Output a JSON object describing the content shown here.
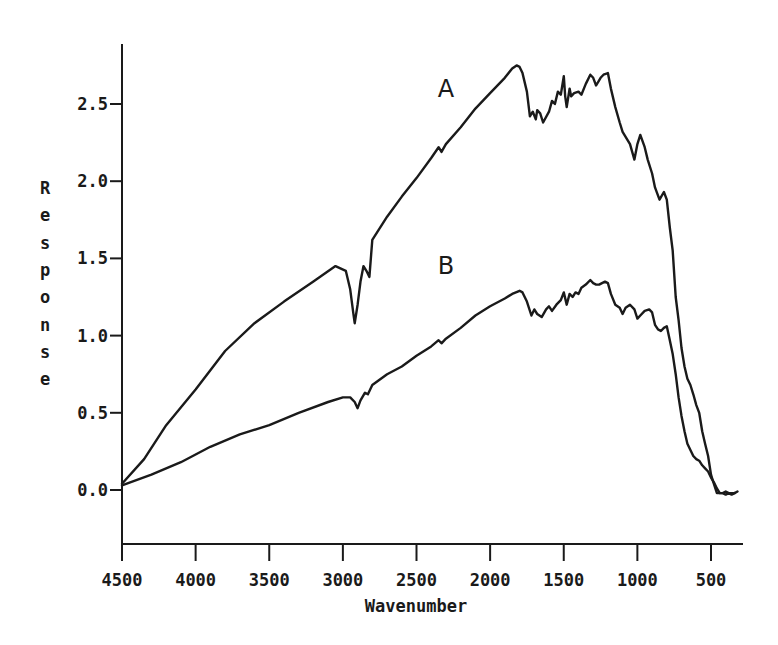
{
  "chart_data": {
    "type": "line",
    "title": "",
    "xlabel": "Wavenumber",
    "ylabel": "Response",
    "xlim": [
      4500,
      300
    ],
    "ylim": [
      -0.15,
      2.8
    ],
    "x_reversed": true,
    "grid": false,
    "legend": "inline labels",
    "x_ticks": [
      4500,
      4000,
      3500,
      3000,
      2500,
      2000,
      1500,
      1000,
      500
    ],
    "x_tick_labels": [
      "4500",
      "4000",
      "3500",
      "3000",
      "2500",
      "2000",
      "1500",
      "1000",
      "500"
    ],
    "y_ticks": [
      0.0,
      0.5,
      1.0,
      1.5,
      2.0,
      2.5
    ],
    "y_tick_labels": [
      "0.0",
      "0.5",
      "1.0",
      "1.5",
      "2.0",
      "2.5"
    ],
    "series": [
      {
        "name": "A",
        "label_position": [
          2300,
          2.6
        ],
        "x": [
          4500,
          4350,
          4200,
          4000,
          3800,
          3600,
          3400,
          3200,
          3050,
          2980,
          2950,
          2930,
          2920,
          2900,
          2880,
          2860,
          2840,
          2820,
          2800,
          2700,
          2600,
          2500,
          2400,
          2350,
          2330,
          2300,
          2200,
          2100,
          2000,
          1900,
          1850,
          1820,
          1800,
          1780,
          1750,
          1730,
          1710,
          1690,
          1680,
          1660,
          1640,
          1600,
          1580,
          1560,
          1540,
          1520,
          1500,
          1490,
          1480,
          1460,
          1450,
          1430,
          1400,
          1380,
          1350,
          1320,
          1300,
          1280,
          1250,
          1230,
          1200,
          1180,
          1150,
          1120,
          1100,
          1050,
          1020,
          1000,
          980,
          950,
          930,
          900,
          880,
          850,
          820,
          800,
          780,
          760,
          750,
          740,
          720,
          700,
          680,
          660,
          640,
          620,
          600,
          580,
          560,
          540,
          520,
          500,
          480,
          460,
          440,
          420,
          400,
          380,
          360,
          340,
          320
        ],
        "y": [
          0.04,
          0.2,
          0.42,
          0.65,
          0.9,
          1.08,
          1.22,
          1.35,
          1.45,
          1.42,
          1.3,
          1.15,
          1.08,
          1.2,
          1.35,
          1.45,
          1.42,
          1.38,
          1.62,
          1.77,
          1.9,
          2.02,
          2.15,
          2.22,
          2.19,
          2.24,
          2.35,
          2.47,
          2.57,
          2.67,
          2.73,
          2.75,
          2.74,
          2.7,
          2.58,
          2.42,
          2.45,
          2.4,
          2.46,
          2.44,
          2.38,
          2.45,
          2.52,
          2.5,
          2.58,
          2.56,
          2.68,
          2.55,
          2.48,
          2.6,
          2.55,
          2.57,
          2.58,
          2.56,
          2.63,
          2.69,
          2.67,
          2.62,
          2.67,
          2.69,
          2.7,
          2.6,
          2.48,
          2.38,
          2.32,
          2.24,
          2.14,
          2.24,
          2.3,
          2.22,
          2.14,
          2.05,
          1.96,
          1.88,
          1.93,
          1.88,
          1.7,
          1.55,
          1.4,
          1.25,
          1.1,
          0.92,
          0.8,
          0.72,
          0.68,
          0.62,
          0.55,
          0.5,
          0.38,
          0.3,
          0.22,
          0.1,
          0.04,
          -0.02,
          -0.02,
          -0.02,
          -0.01,
          -0.02,
          -0.02,
          -0.02,
          -0.01
        ],
        "color": "#1a1a1a"
      },
      {
        "name": "B",
        "label_position": [
          2300,
          1.45
        ],
        "x": [
          4500,
          4300,
          4100,
          3900,
          3700,
          3500,
          3300,
          3100,
          3000,
          2950,
          2920,
          2900,
          2880,
          2850,
          2830,
          2800,
          2700,
          2600,
          2500,
          2400,
          2350,
          2330,
          2300,
          2200,
          2100,
          2000,
          1900,
          1850,
          1800,
          1780,
          1750,
          1720,
          1700,
          1680,
          1650,
          1620,
          1600,
          1580,
          1550,
          1520,
          1500,
          1480,
          1460,
          1440,
          1420,
          1400,
          1380,
          1350,
          1320,
          1300,
          1280,
          1260,
          1240,
          1220,
          1200,
          1180,
          1150,
          1120,
          1100,
          1080,
          1050,
          1020,
          1000,
          980,
          950,
          920,
          900,
          880,
          860,
          840,
          820,
          800,
          780,
          760,
          740,
          720,
          700,
          680,
          660,
          640,
          620,
          600,
          580,
          560,
          540,
          520,
          500,
          480,
          460,
          440,
          420,
          400,
          380,
          360,
          340
        ],
        "y": [
          0.03,
          0.1,
          0.18,
          0.28,
          0.36,
          0.42,
          0.5,
          0.57,
          0.6,
          0.6,
          0.57,
          0.53,
          0.58,
          0.63,
          0.62,
          0.68,
          0.75,
          0.8,
          0.87,
          0.93,
          0.97,
          0.95,
          0.98,
          1.05,
          1.13,
          1.19,
          1.24,
          1.27,
          1.29,
          1.28,
          1.22,
          1.13,
          1.17,
          1.14,
          1.12,
          1.17,
          1.19,
          1.16,
          1.2,
          1.23,
          1.28,
          1.2,
          1.27,
          1.25,
          1.28,
          1.27,
          1.31,
          1.33,
          1.36,
          1.34,
          1.33,
          1.33,
          1.34,
          1.35,
          1.34,
          1.27,
          1.2,
          1.18,
          1.14,
          1.18,
          1.2,
          1.17,
          1.11,
          1.13,
          1.16,
          1.17,
          1.15,
          1.07,
          1.04,
          1.03,
          1.05,
          1.06,
          0.97,
          0.88,
          0.75,
          0.6,
          0.48,
          0.38,
          0.3,
          0.26,
          0.22,
          0.2,
          0.19,
          0.16,
          0.14,
          0.12,
          0.08,
          0.05,
          0.01,
          -0.02,
          -0.02,
          -0.03,
          -0.02,
          -0.03,
          -0.02
        ],
        "color": "#1a1a1a"
      }
    ]
  }
}
